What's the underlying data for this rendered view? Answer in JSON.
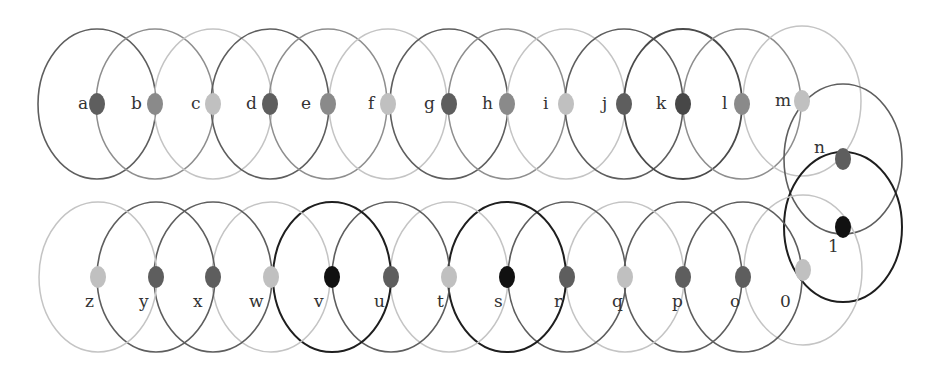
{
  "diagram": {
    "title": "",
    "width": 945,
    "height": 373,
    "tone_colors": {
      "black": {
        "stroke": "#1e1e1e",
        "fill": "#111111",
        "stroke_width": 2.0
      },
      "darker": {
        "stroke": "#4a4a4a",
        "fill": "#474747",
        "stroke_width": 1.8
      },
      "dark": {
        "stroke": "#5e5e5e",
        "fill": "#5e5e5e",
        "stroke_width": 1.6
      },
      "medium": {
        "stroke": "#8e8e8e",
        "fill": "#8a8a8a",
        "stroke_width": 1.5
      },
      "light": {
        "stroke": "#c4c4c4",
        "fill": "#c0c0c0",
        "stroke_width": 1.5
      }
    },
    "circle_radius": {
      "rx": 59,
      "ry": 75
    },
    "dot_radius": {
      "rx": 8,
      "ry": 11
    },
    "nodes": [
      {
        "label": "a",
        "cx": 97,
        "cy": 104,
        "tone": "dark",
        "label_x": 78,
        "label_y": 109,
        "row": "top"
      },
      {
        "label": "b",
        "cx": 155,
        "cy": 104,
        "tone": "medium",
        "label_x": 131,
        "label_y": 109,
        "row": "top"
      },
      {
        "label": "c",
        "cx": 213,
        "cy": 104,
        "tone": "light",
        "label_x": 191,
        "label_y": 109,
        "row": "top"
      },
      {
        "label": "d",
        "cx": 270,
        "cy": 104,
        "tone": "dark",
        "label_x": 246,
        "label_y": 109,
        "row": "top"
      },
      {
        "label": "e",
        "cx": 328,
        "cy": 104,
        "tone": "medium",
        "label_x": 301,
        "label_y": 109,
        "row": "top"
      },
      {
        "label": "f",
        "cx": 388,
        "cy": 104,
        "tone": "light",
        "label_x": 368,
        "label_y": 109,
        "row": "top"
      },
      {
        "label": "g",
        "cx": 449,
        "cy": 104,
        "tone": "dark",
        "label_x": 424,
        "label_y": 109,
        "row": "top"
      },
      {
        "label": "h",
        "cx": 507,
        "cy": 104,
        "tone": "medium",
        "label_x": 482,
        "label_y": 109,
        "row": "top"
      },
      {
        "label": "i",
        "cx": 566,
        "cy": 104,
        "tone": "light",
        "label_x": 543,
        "label_y": 109,
        "row": "top"
      },
      {
        "label": "j",
        "cx": 624,
        "cy": 104,
        "tone": "dark",
        "label_x": 602,
        "label_y": 109,
        "row": "top"
      },
      {
        "label": "k",
        "cx": 683,
        "cy": 104,
        "tone": "darker",
        "label_x": 656,
        "label_y": 109,
        "row": "top"
      },
      {
        "label": "l",
        "cx": 742,
        "cy": 104,
        "tone": "medium",
        "label_x": 722,
        "label_y": 109,
        "row": "top"
      },
      {
        "label": "m",
        "cx": 802,
        "cy": 101,
        "tone": "light",
        "label_x": 775,
        "label_y": 106,
        "row": "top"
      },
      {
        "label": "n",
        "cx": 843,
        "cy": 159,
        "tone": "dark",
        "label_x": 814,
        "label_y": 153,
        "row": "right"
      },
      {
        "label": "1",
        "cx": 843,
        "cy": 227,
        "tone": "black",
        "label_x": 828,
        "label_y": 252,
        "row": "right"
      },
      {
        "label": "0",
        "cx": 803,
        "cy": 270,
        "tone": "light",
        "label_x": 780,
        "label_y": 307,
        "row": "bottom"
      },
      {
        "label": "o",
        "cx": 743,
        "cy": 277,
        "tone": "dark",
        "label_x": 730,
        "label_y": 307,
        "row": "bottom"
      },
      {
        "label": "p",
        "cx": 683,
        "cy": 277,
        "tone": "dark",
        "label_x": 672,
        "label_y": 307,
        "row": "bottom"
      },
      {
        "label": "q",
        "cx": 625,
        "cy": 277,
        "tone": "light",
        "label_x": 612,
        "label_y": 307,
        "row": "bottom"
      },
      {
        "label": "r",
        "cx": 567,
        "cy": 277,
        "tone": "dark",
        "label_x": 554,
        "label_y": 307,
        "row": "bottom"
      },
      {
        "label": "s",
        "cx": 507,
        "cy": 277,
        "tone": "black",
        "label_x": 494,
        "label_y": 307,
        "row": "bottom"
      },
      {
        "label": "t",
        "cx": 449,
        "cy": 277,
        "tone": "light",
        "label_x": 437,
        "label_y": 307,
        "row": "bottom"
      },
      {
        "label": "u",
        "cx": 391,
        "cy": 277,
        "tone": "dark",
        "label_x": 374,
        "label_y": 307,
        "row": "bottom"
      },
      {
        "label": "v",
        "cx": 332,
        "cy": 277,
        "tone": "black",
        "label_x": 314,
        "label_y": 307,
        "row": "bottom"
      },
      {
        "label": "w",
        "cx": 271,
        "cy": 277,
        "tone": "light",
        "label_x": 249,
        "label_y": 307,
        "row": "bottom"
      },
      {
        "label": "x",
        "cx": 213,
        "cy": 277,
        "tone": "dark",
        "label_x": 193,
        "label_y": 307,
        "row": "bottom"
      },
      {
        "label": "y",
        "cx": 156,
        "cy": 277,
        "tone": "dark",
        "label_x": 139,
        "label_y": 307,
        "row": "bottom"
      },
      {
        "label": "z",
        "cx": 98,
        "cy": 277,
        "tone": "light",
        "label_x": 85,
        "label_y": 307,
        "row": "bottom"
      }
    ]
  }
}
